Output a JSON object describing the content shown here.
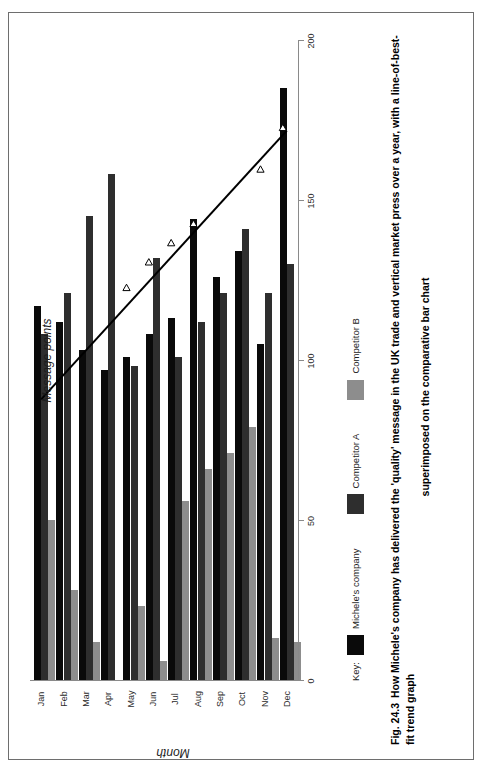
{
  "figure": {
    "number": "Fig. 24.3",
    "caption_line1": "How Michele's company has delivered the 'quality' message in the UK trade and vertical market press over a year, with a line-of-best-fit trend graph",
    "caption_line2": "superimposed on the comparative bar chart"
  },
  "legend": {
    "key_label": "Key:",
    "items": [
      {
        "label": "Michele's company",
        "color": "#0a0a0a"
      },
      {
        "label": "Competitor A",
        "color": "#2e2e2e"
      },
      {
        "label": "Competitor B",
        "color": "#8d8d8d"
      }
    ]
  },
  "chart_data": {
    "type": "bar",
    "orientation": "horizontal",
    "title": "",
    "xlabel": "Message points",
    "ylabel": "Month",
    "xlim": [
      -50,
      200
    ],
    "xticks": [
      200,
      150,
      100,
      50,
      0,
      -50
    ],
    "xticklabels": [
      "200",
      "150",
      "100",
      "50",
      "0",
      "-50"
    ],
    "grid": false,
    "legend_position": "below-left",
    "categories": [
      "Jan",
      "Feb",
      "Mar",
      "Apr",
      "May",
      "Jun",
      "Jul",
      "Aug",
      "Sep",
      "Oct",
      "Nov",
      "Dec"
    ],
    "series": [
      {
        "name": "Michele's company",
        "color": "#0a0a0a",
        "values": [
          117,
          112,
          103,
          97,
          101,
          108,
          113,
          144,
          126,
          134,
          105,
          185
        ]
      },
      {
        "name": "Competitor A",
        "color": "#2e2e2e",
        "values": [
          108,
          121,
          145,
          158,
          98,
          132,
          101,
          112,
          121,
          141,
          121,
          130
        ]
      },
      {
        "name": "Competitor B",
        "color": "#8d8d8d",
        "values": [
          50,
          28,
          12,
          0,
          23,
          6,
          56,
          66,
          71,
          79,
          13,
          12
        ]
      }
    ],
    "trendline": {
      "name": "line-of-best-fit",
      "marker": "open-triangle",
      "color": "#000000",
      "start": {
        "x": 88,
        "category": "Jan"
      },
      "end": {
        "x": 172,
        "category": "Dec"
      },
      "markers": [
        {
          "category": "May",
          "x": 122
        },
        {
          "category": "Jun",
          "x": 130
        },
        {
          "category": "Jul",
          "x": 136
        },
        {
          "category": "Aug",
          "x": 142
        },
        {
          "category": "Nov",
          "x": 159
        },
        {
          "category": "Dec",
          "x": 172
        }
      ]
    }
  }
}
